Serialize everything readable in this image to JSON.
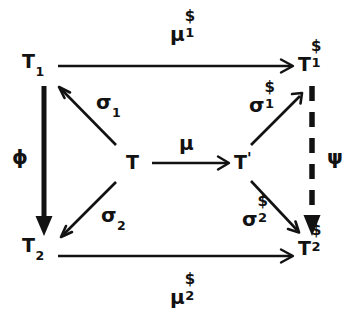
{
  "diagram": {
    "ink_color": "#121212",
    "background": "#ffffff",
    "nodes": [
      {
        "id": "T1",
        "base": "T",
        "sub": "1",
        "sup": "",
        "prime": "",
        "x": 30,
        "y": 62,
        "label": "T1"
      },
      {
        "id": "T1dollar",
        "base": "T",
        "sub": "1",
        "sup": "$",
        "prime": "",
        "x": 307,
        "y": 62,
        "label": "T1$"
      },
      {
        "id": "T",
        "base": "T",
        "sub": "",
        "sup": "",
        "prime": "",
        "x": 130,
        "y": 162,
        "label": "T"
      },
      {
        "id": "Tprime",
        "base": "T",
        "sub": "",
        "sup": "",
        "prime": "'",
        "x": 240,
        "y": 162,
        "label": "T'"
      },
      {
        "id": "T2",
        "base": "T",
        "sub": "2",
        "sup": "",
        "prime": "",
        "x": 30,
        "y": 243,
        "label": "T2"
      },
      {
        "id": "T2dollar",
        "base": "T",
        "sub": "2",
        "sup": "$",
        "prime": "",
        "x": 307,
        "y": 243,
        "label": "T2$"
      }
    ],
    "edges": [
      {
        "id": "mu1dollar",
        "from": "T1",
        "to": "T1dollar",
        "style": "solid-thin",
        "direction": "right",
        "label": {
          "base": "μ",
          "sup": "$",
          "sub": "1"
        },
        "label_x": 170,
        "label_y": 22
      },
      {
        "id": "mu2dollar",
        "from": "T2",
        "to": "T2dollar",
        "style": "solid-thin",
        "direction": "right",
        "label": {
          "base": "μ",
          "sup": "$",
          "sub": "2"
        },
        "label_x": 170,
        "label_y": 285
      },
      {
        "id": "phi",
        "from": "T1",
        "to": "T2",
        "style": "solid-thick",
        "direction": "down",
        "label": {
          "base": "ϕ",
          "sup": "",
          "sub": ""
        },
        "label_x": 12,
        "label_y": 147
      },
      {
        "id": "psi",
        "from": "T1dollar",
        "to": "T2dollar",
        "style": "dashed-thick",
        "direction": "down",
        "label": {
          "base": "ψ",
          "sup": "",
          "sub": ""
        },
        "label_x": 327,
        "label_y": 147
      },
      {
        "id": "mu",
        "from": "T",
        "to": "Tprime",
        "style": "solid-thin",
        "direction": "right",
        "label": {
          "base": "μ",
          "sup": "",
          "sub": ""
        },
        "label_x": 179,
        "label_y": 133
      },
      {
        "id": "sigma1",
        "from": "T",
        "to": "T1",
        "style": "solid-thin",
        "direction": "up-left",
        "label": {
          "base": "σ",
          "sup": "",
          "sub": "1"
        },
        "label_x": 96,
        "label_y": 92
      },
      {
        "id": "sigma2",
        "from": "T",
        "to": "T2",
        "style": "solid-thin",
        "direction": "down-left",
        "label": {
          "base": "σ",
          "sup": "",
          "sub": "2"
        },
        "label_x": 101,
        "label_y": 205
      },
      {
        "id": "sigma1dollar",
        "from": "Tprime",
        "to": "T1dollar",
        "style": "solid-thin",
        "direction": "up-right",
        "label": {
          "base": "σ",
          "sup": "$",
          "sub": "1"
        },
        "label_x": 249,
        "label_y": 93
      },
      {
        "id": "sigma2dollar",
        "from": "Tprime",
        "to": "T2dollar",
        "style": "solid-thin",
        "direction": "down-right",
        "label": {
          "base": "σ",
          "sup": "$",
          "sub": "2"
        },
        "label_x": 242,
        "label_y": 207
      }
    ]
  }
}
